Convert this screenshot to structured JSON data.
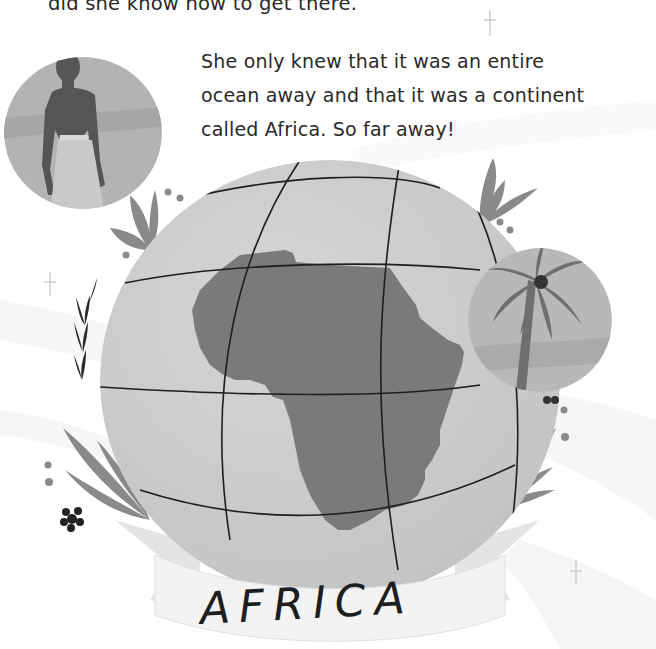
{
  "page": {
    "top_text_fragment": "did she know how to get there.",
    "paragraph_lines": [
      "She only knew that it was an entire",
      "ocean away and that it was a continent",
      "called Africa. So far away!"
    ],
    "banner_label": "AFRICA"
  },
  "illustration": {
    "portrait_circle": "man-in-grass-skirt-portrait",
    "globe": "globe-showing-africa",
    "palm_circle": "palm-tree-vignette",
    "colors": {
      "globe_fill": "#c9c9c9",
      "continent_fill": "#7a7a7a",
      "grid_lines": "#1e1e1e",
      "leaf_fill": "#8a8a8a",
      "banner_fill": "#f2f2f2",
      "banner_fold": "#d8d8d8",
      "text": "#2a2a2a"
    }
  }
}
